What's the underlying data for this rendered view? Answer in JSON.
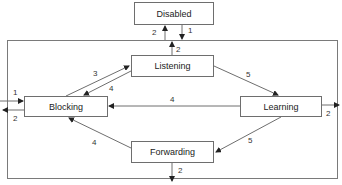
{
  "diagram": {
    "type": "state-diagram",
    "colors": {
      "line": "#6e6e6e",
      "text": "#222222",
      "background": "#ffffff"
    },
    "states": [
      {
        "id": "disabled",
        "label": "Disabled"
      },
      {
        "id": "listening",
        "label": "Listening"
      },
      {
        "id": "blocking",
        "label": "Blocking"
      },
      {
        "id": "learning",
        "label": "Learning"
      },
      {
        "id": "forwarding",
        "label": "Forwarding"
      }
    ],
    "edges": [
      {
        "from": "frame",
        "to": "disabled",
        "label": "2"
      },
      {
        "from": "disabled",
        "to": "frame",
        "label": "1"
      },
      {
        "from": "listening",
        "to": "frame",
        "label": "2"
      },
      {
        "from": "blocking",
        "to": "listening",
        "label": "3"
      },
      {
        "from": "listening",
        "to": "blocking",
        "label": "4"
      },
      {
        "from": "listening",
        "to": "learning",
        "label": "5"
      },
      {
        "from": "learning",
        "to": "blocking",
        "label": "4"
      },
      {
        "from": "learning",
        "to": "forwarding",
        "label": "5"
      },
      {
        "from": "forwarding",
        "to": "blocking",
        "label": "4"
      },
      {
        "from": "external",
        "to": "blocking",
        "label": "1"
      },
      {
        "from": "blocking",
        "to": "external",
        "label": "2"
      },
      {
        "from": "learning",
        "to": "external",
        "label": "2"
      },
      {
        "from": "forwarding",
        "to": "external",
        "label": "2"
      }
    ]
  }
}
